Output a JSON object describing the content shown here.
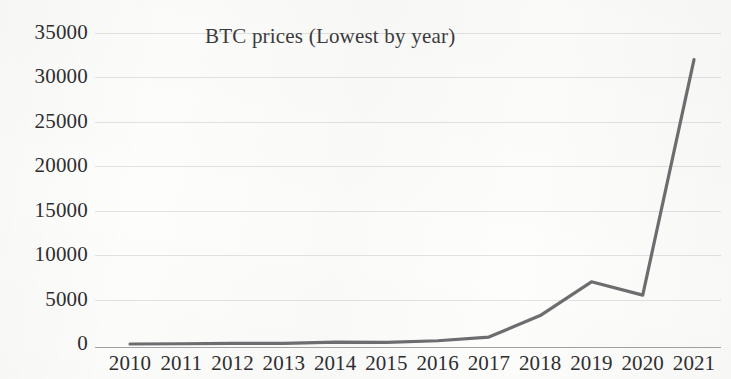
{
  "chart_data": {
    "type": "line",
    "title": "BTC prices (Lowest by year)",
    "xlabel": "",
    "ylabel": "",
    "categories": [
      "2010",
      "2011",
      "2012",
      "2013",
      "2014",
      "2015",
      "2016",
      "2017",
      "2018",
      "2019",
      "2020",
      "2021"
    ],
    "series": [
      {
        "name": "BTC lowest price",
        "values": [
          0,
          30,
          60,
          65,
          200,
          185,
          365,
          780,
          3200,
          7000,
          5500,
          32000
        ],
        "color": "#6d6d70"
      }
    ],
    "ylim": [
      0,
      35000
    ],
    "ytick_labels": [
      "35000",
      "30000",
      "25000",
      "20000",
      "15000",
      "10000",
      "5000",
      "0"
    ],
    "ytick_values": [
      35000,
      30000,
      25000,
      20000,
      15000,
      10000,
      5000,
      0
    ],
    "grid": true,
    "grid_axis": "y",
    "legend": false,
    "legend_position": "none"
  }
}
